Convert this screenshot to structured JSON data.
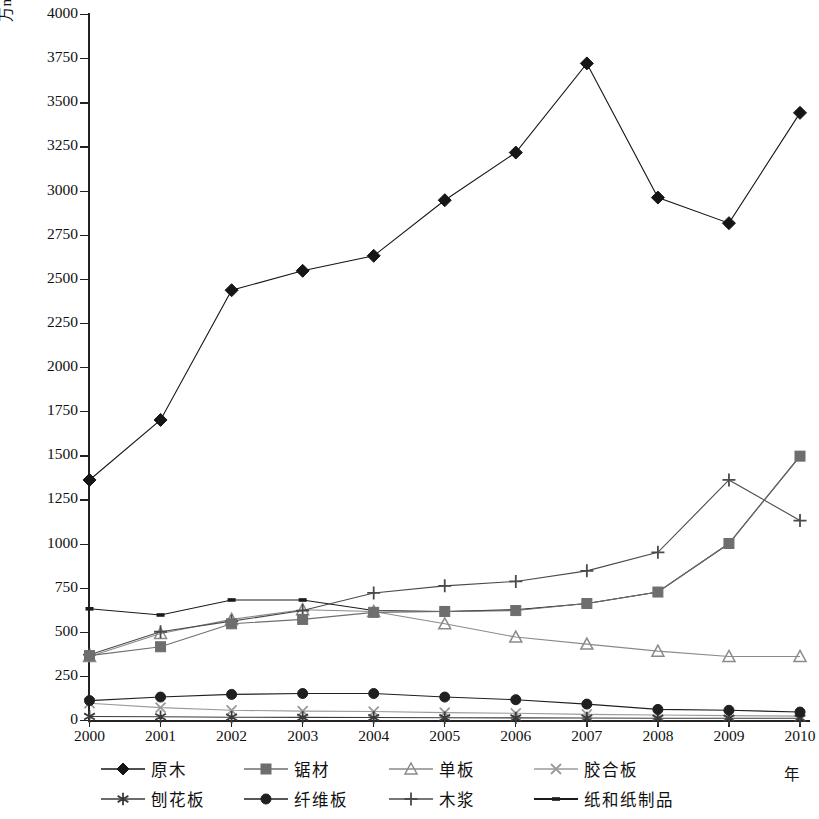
{
  "axis": {
    "y_label": "万m3, 万t",
    "y_label_base": "万m",
    "y_label_sup": "3",
    "y_label_tail": ", 万t",
    "x_unit": "年",
    "y_ticks": [
      "4000",
      "3750",
      "3500",
      "3250",
      "3000",
      "2750",
      "2500",
      "2250",
      "2000",
      "1750",
      "1500",
      "1250",
      "1000",
      "750",
      "500",
      "250",
      "0"
    ],
    "x_ticks": [
      "2000",
      "2001",
      "2002",
      "2003",
      "2004",
      "2005",
      "2006",
      "2007",
      "2008",
      "2009",
      "2010"
    ]
  },
  "legend": {
    "row1": [
      {
        "label": "原木",
        "marker": "diamond",
        "color": "#161616"
      },
      {
        "label": "锯材",
        "marker": "square",
        "color": "#6e6e6e"
      },
      {
        "label": "单板",
        "marker": "triangle",
        "color": "#8a8a8a"
      },
      {
        "label": "胶合板",
        "marker": "cross-x",
        "color": "#9a9a9a"
      }
    ],
    "row2": [
      {
        "label": "刨花板",
        "marker": "asterisk",
        "color": "#3a3a3a"
      },
      {
        "label": "纤维板",
        "marker": "circle",
        "color": "#1f1f1f"
      },
      {
        "label": "木浆",
        "marker": "plus",
        "color": "#4a4a4a"
      },
      {
        "label": "纸和纸制品",
        "marker": "dash",
        "color": "#1a1a1a"
      }
    ]
  },
  "chart_data": {
    "type": "line",
    "title": "",
    "xlabel": "年",
    "ylabel": "万m3, 万t",
    "ylim": [
      0,
      4000
    ],
    "ytick_step": 250,
    "grid": false,
    "legend_position": "bottom",
    "categories": [
      "2000",
      "2001",
      "2002",
      "2003",
      "2004",
      "2005",
      "2006",
      "2007",
      "2008",
      "2009",
      "2010"
    ],
    "series": [
      {
        "name": "原木",
        "marker": "diamond",
        "color": "#161616",
        "values": [
          1360,
          1700,
          2435,
          2545,
          2630,
          2945,
          3215,
          3720,
          2960,
          2815,
          3440
        ]
      },
      {
        "name": "锯材",
        "marker": "square",
        "color": "#6e6e6e",
        "values": [
          365,
          415,
          545,
          570,
          610,
          615,
          620,
          660,
          725,
          1000,
          1495
        ]
      },
      {
        "name": "单板",
        "marker": "triangle",
        "color": "#8a8a8a",
        "values": [
          360,
          490,
          570,
          625,
          615,
          545,
          470,
          430,
          390,
          360,
          360
        ]
      },
      {
        "name": "胶合板",
        "marker": "cross-x",
        "color": "#9a9a9a",
        "values": [
          95,
          70,
          55,
          50,
          48,
          42,
          38,
          32,
          28,
          25,
          22
        ]
      },
      {
        "name": "刨花板",
        "marker": "asterisk",
        "color": "#3a3a3a",
        "values": [
          20,
          18,
          16,
          15,
          14,
          13,
          12,
          11,
          10,
          10,
          10
        ]
      },
      {
        "name": "纤维板",
        "marker": "circle",
        "color": "#1f1f1f",
        "values": [
          110,
          130,
          145,
          150,
          150,
          130,
          115,
          90,
          60,
          55,
          45
        ]
      },
      {
        "name": "木浆",
        "marker": "plus",
        "color": "#4a4a4a",
        "values": [
          370,
          500,
          560,
          620,
          720,
          760,
          785,
          845,
          950,
          1360,
          1130
        ]
      },
      {
        "name": "纸和纸制品",
        "marker": "dash",
        "color": "#1a1a1a",
        "values": [
          630,
          595,
          680,
          680,
          620,
          615,
          625,
          660,
          725,
          1000,
          1495
        ]
      }
    ]
  }
}
